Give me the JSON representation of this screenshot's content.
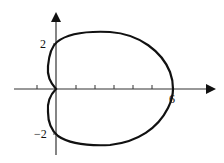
{
  "figure": {
    "x_axis_tick_labels": [
      {
        "value": 6,
        "label": "6"
      }
    ],
    "y_axis_tick_labels": [
      {
        "value": 2,
        "label": "2"
      },
      {
        "value": -2,
        "label": "−2"
      }
    ],
    "x_ticks": [
      -1,
      1,
      2,
      3,
      4,
      5
    ],
    "curve_intercepts": {
      "x": [
        0,
        6
      ],
      "y": [
        2,
        -2,
        0
      ]
    },
    "colors": {
      "stroke": "#111111",
      "background": "#ffffff"
    }
  }
}
